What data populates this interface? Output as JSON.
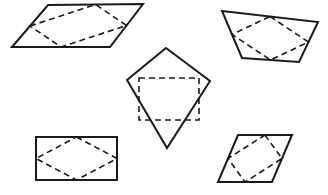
{
  "figure": {
    "canvas": {
      "width": 328,
      "height": 195,
      "background": "#ffffff"
    },
    "stroke_colors": {
      "outer": "#1a1a1a",
      "inner": "#1a1a1a"
    },
    "shapes": [
      {
        "id": "top-left-parallelogram",
        "label": "Parallelogram with inscribed parallelogram",
        "outer_kind": "parallelogram",
        "outer_points": "12,47 48,5 143,4 110,47",
        "inner_kind": "parallelogram",
        "inner_points": "30,26 95.5,4.5 126.5,25.5 61,47"
      },
      {
        "id": "top-right-trapezoid",
        "label": "Trapezoid with inscribed parallelogram",
        "outer_kind": "trapezoid",
        "outer_points": "222,11 318,22 299,62 242,58",
        "inner_kind": "parallelogram",
        "inner_points": "270,16.5 308.5,42 270.5,60 232,34.5"
      },
      {
        "id": "center-kite",
        "label": "Kite with inscribed rectangle",
        "outer_kind": "kite",
        "outer_points": "166,48 210,81 167,148 127,80",
        "inner_kind": "rectangle",
        "inner_points": "139,78 199,78 199,120 139,120"
      },
      {
        "id": "bottom-left-rectangle",
        "label": "Rectangle with inscribed rhombus",
        "outer_kind": "rectangle",
        "outer_points": "36,137 117,137 117,180 36,180",
        "inner_kind": "rhombus",
        "inner_points": "76.5,137 117,158.5 76.5,180 36,158.5"
      },
      {
        "id": "bottom-right-rhombus",
        "label": "Rhombus with inscribed rectangle",
        "outer_kind": "rhombus",
        "outer_points": "238,135 292,135 272,182 218,182",
        "inner_kind": "rectangle",
        "inner_points": "265,135 282,158.5 245,182 228,158.5"
      }
    ]
  }
}
